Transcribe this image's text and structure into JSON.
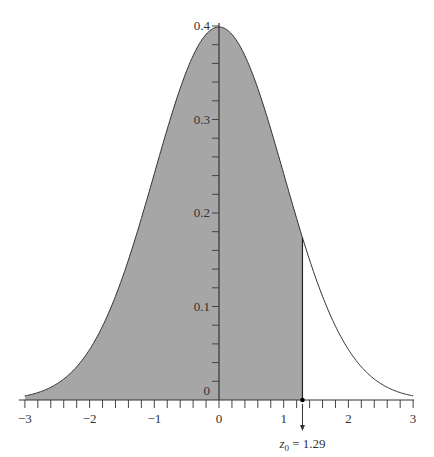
{
  "chart_data": {
    "type": "area",
    "title": "",
    "function": "standard normal pdf",
    "x_range": [
      -3,
      3
    ],
    "y_range": [
      0,
      0.4
    ],
    "xlabel": "",
    "ylabel": "",
    "x_ticks": [
      -3,
      -2,
      -1,
      0,
      1,
      2,
      3
    ],
    "x_tick_labels": [
      "−3",
      "−2",
      "−1",
      "0",
      "1",
      "2",
      "3"
    ],
    "x_minor_step": 0.2,
    "y_ticks": [
      0,
      0.1,
      0.2,
      0.3,
      0.4
    ],
    "y_tick_labels": [
      "0",
      "0.1",
      "0.2",
      "0.3",
      "0.4"
    ],
    "y_minor_step": 0.02,
    "shaded_region": {
      "from": -3,
      "to": 1.29,
      "color": "#a6a6a6"
    },
    "cutoff": {
      "z": 1.29,
      "label_var": "z",
      "label_sub": "0",
      "label_eq": "=",
      "label_value": "1.29"
    },
    "curve_color": "#333333",
    "grid": false,
    "legend": null
  }
}
